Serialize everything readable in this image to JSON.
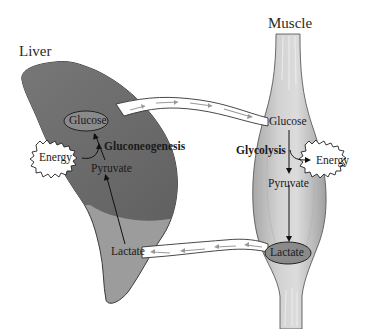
{
  "diagram": {
    "colors": {
      "liver_upper": "#6f6f6f",
      "liver_lower": "#9c9c9c",
      "muscle": "#c9c9c9",
      "muscle_fiber": "#e8e8e8",
      "pill_fill": "#8a8a8a",
      "arrow_line": "#111111",
      "channel_fill": "#ffffff",
      "channel_arrow": "#9a9a9a"
    },
    "liver": {
      "title": "Liver",
      "process": "Gluconeogenesis",
      "nodes": {
        "glucose": "Glucose",
        "pyruvate": "Pyruvate",
        "lactate": "Lactate",
        "energy": "Energy"
      }
    },
    "muscle": {
      "title": "Muscle",
      "process": "Glycolysis",
      "nodes": {
        "glucose": "Glucose",
        "pyruvate": "Pyruvate",
        "lactate": "Lactate",
        "energy": "Energy"
      }
    },
    "transport": [
      {
        "from": "Liver Glucose",
        "to": "Muscle Glucose",
        "direction": "right"
      },
      {
        "from": "Muscle Lactate",
        "to": "Liver Lactate",
        "direction": "left"
      }
    ],
    "flows": [
      {
        "organ": "Liver",
        "steps": [
          "Lactate",
          "Pyruvate",
          "Glucose"
        ],
        "energy": "consumed"
      },
      {
        "organ": "Muscle",
        "steps": [
          "Glucose",
          "Pyruvate",
          "Lactate"
        ],
        "energy": "produced"
      }
    ]
  }
}
